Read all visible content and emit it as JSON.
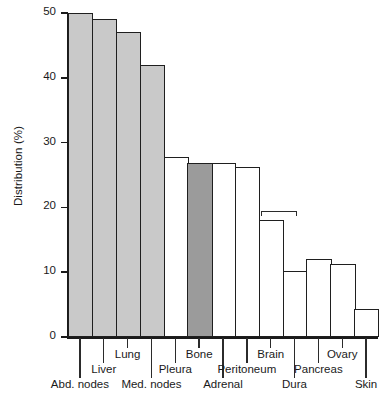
{
  "chart_data": {
    "type": "bar",
    "title": "",
    "xlabel": "",
    "ylabel": "Distribution (%)",
    "ylim": [
      0,
      50
    ],
    "yticks": [
      0,
      10,
      20,
      30,
      40,
      50
    ],
    "ytick_labels": [
      "0",
      "10",
      "20",
      "30",
      "40",
      "50"
    ],
    "grid": false,
    "legend": "none",
    "categories": [
      "Abd. nodes",
      "Liver",
      "Lung",
      "Med. nodes",
      "Pleura",
      "Bone",
      "Adrenal",
      "Peritoneum",
      "Brain",
      "Dura",
      "Pancreas",
      "Ovary",
      "Skin"
    ],
    "values": [
      50,
      49,
      47,
      42,
      27.8,
      26.8,
      26.8,
      26.2,
      18,
      10.2,
      12,
      11.2,
      4.3
    ],
    "bars": [
      {
        "label": "Abd. nodes",
        "value": 50,
        "fill": "#c9c9c9",
        "label_row": 2
      },
      {
        "label": "Liver",
        "value": 49,
        "fill": "#c9c9c9",
        "label_row": 1
      },
      {
        "label": "Lung",
        "value": 47,
        "fill": "#c9c9c9",
        "label_row": 0
      },
      {
        "label": "Med. nodes",
        "value": 42,
        "fill": "#c9c9c9",
        "label_row": 2
      },
      {
        "label": "Pleura",
        "value": 27.8,
        "fill": "#ffffff",
        "label_row": 1
      },
      {
        "label": "Bone",
        "value": 26.8,
        "fill": "#9b9b9b",
        "label_row": 0
      },
      {
        "label": "Adrenal",
        "value": 26.8,
        "fill": "#ffffff",
        "label_row": 2
      },
      {
        "label": "Peritoneum",
        "value": 26.2,
        "fill": "#ffffff",
        "label_row": 1
      },
      {
        "label": "Brain",
        "value": 18,
        "fill": "#ffffff",
        "label_row": 0
      },
      {
        "label": "Dura",
        "value": 10.2,
        "fill": "#ffffff",
        "label_row": 2
      },
      {
        "label": "Pancreas",
        "value": 12,
        "fill": "#ffffff",
        "label_row": 1
      },
      {
        "label": "Ovary",
        "value": 11.2,
        "fill": "#ffffff",
        "label_row": 0
      },
      {
        "label": "Skin",
        "value": 4.3,
        "fill": "#ffffff",
        "label_row": 2
      }
    ],
    "annotations": [
      {
        "name": "bracket",
        "type": "bracket",
        "from_category": "Brain",
        "to_category": "Dura",
        "y": 19.5
      }
    ]
  },
  "colors": {
    "bar_light_gray": "#c9c9c9",
    "bar_dark_gray": "#9b9b9b",
    "bar_white": "#ffffff",
    "outline": "#1f1f1f",
    "axis": "#1a1a1a",
    "background": "#ffffff"
  }
}
